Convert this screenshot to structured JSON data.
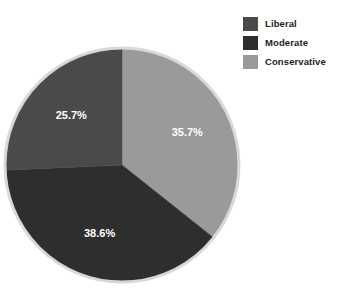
{
  "chart_data": {
    "type": "pie",
    "title": "",
    "categories": [
      "Liberal",
      "Moderate",
      "Conservative"
    ],
    "values": [
      25.7,
      38.6,
      35.7
    ],
    "labels": [
      "25.7%",
      "38.6%",
      "35.7%"
    ],
    "colors": [
      "#4a4a4a",
      "#2e2e2e",
      "#9a9a9a"
    ],
    "legend_position": "top-right",
    "start_angle_deg": 0,
    "direction": "clockwise",
    "grid": false,
    "units": "percent"
  },
  "legend": {
    "items": [
      {
        "label": "Liberal",
        "color": "#4a4a4a"
      },
      {
        "label": "Moderate",
        "color": "#2e2e2e"
      },
      {
        "label": "Conservative",
        "color": "#9a9a9a"
      }
    ]
  },
  "pie": {
    "outline_color": "#d8d8d8",
    "center_x": 122,
    "center_y": 165,
    "radius": 117
  }
}
